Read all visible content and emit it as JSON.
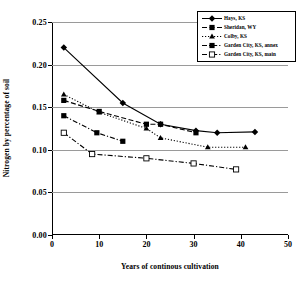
{
  "chart_data": {
    "type": "line",
    "title": "",
    "xlabel": "Years of continous cultivation",
    "ylabel": "Nitrogen by percentage of soil",
    "xlim": [
      0,
      50
    ],
    "ylim": [
      0,
      0.25
    ],
    "xticks": [
      0,
      10,
      20,
      30,
      40,
      50
    ],
    "xtick_labels": [
      "0",
      "10",
      "20",
      "30",
      "40",
      "50"
    ],
    "yticks": [
      0,
      0.05,
      0.1,
      0.15,
      0.2,
      0.25
    ],
    "ytick_labels": [
      "0.00",
      "0.05",
      "0.10",
      "0.15",
      "0.20",
      "0.25"
    ],
    "grid": "horizontal",
    "legend_position": "top-right",
    "series": [
      {
        "name": "Hays, KS",
        "line_style": "solid",
        "marker": "diamond-filled",
        "color": "#000000",
        "points": [
          [
            2.5,
            0.22
          ],
          [
            15.0,
            0.155
          ],
          [
            23.0,
            0.13
          ],
          [
            30.5,
            0.1225
          ],
          [
            35.0,
            0.12
          ],
          [
            43.0,
            0.121
          ]
        ]
      },
      {
        "name": "Sheridan, WY",
        "line_style": "dashed",
        "marker": "square-filled",
        "color": "#000000",
        "points": [
          [
            2.5,
            0.158
          ],
          [
            10.0,
            0.145
          ],
          [
            20.0,
            0.13
          ],
          [
            23.0,
            0.13
          ],
          [
            30.5,
            0.12
          ]
        ]
      },
      {
        "name": "Colby, KS",
        "line_style": "dotted",
        "marker": "triangle-filled",
        "color": "#000000",
        "points": [
          [
            2.5,
            0.165
          ],
          [
            10.0,
            0.144
          ],
          [
            20.0,
            0.125
          ],
          [
            23.0,
            0.114
          ],
          [
            33.0,
            0.103
          ],
          [
            41.0,
            0.103
          ]
        ]
      },
      {
        "name": "Garden City, KS, annex",
        "line_style": "dash-dot",
        "marker": "square-filled",
        "color": "#000000",
        "points": [
          [
            2.5,
            0.14
          ],
          [
            9.5,
            0.12
          ],
          [
            15.0,
            0.11
          ]
        ]
      },
      {
        "name": "Garden City, KS, main",
        "line_style": "dash-dot",
        "marker": "square-open",
        "color": "#000000",
        "points": [
          [
            2.5,
            0.12
          ],
          [
            8.5,
            0.095
          ],
          [
            20.0,
            0.09
          ],
          [
            30.0,
            0.084
          ],
          [
            39.0,
            0.077
          ]
        ]
      }
    ]
  }
}
